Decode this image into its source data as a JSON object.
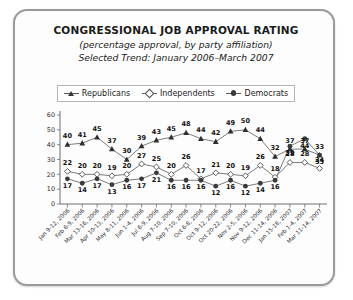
{
  "titles": {
    "main": "CONGRESSIONAL JOB APPROVAL RATING",
    "sub1": "(percentage approval, by party affiliation)",
    "sub2": "Selected Trend: January 2006–March 2007"
  },
  "legend": {
    "items": [
      {
        "label": "Republicans",
        "marker": "triangle-marker",
        "color": "#2e2e2e"
      },
      {
        "label": "Independents",
        "marker": "diamond-marker",
        "color": "#ffffff"
      },
      {
        "label": "Democrats",
        "marker": "circle-marker",
        "color": "#3a3a3a"
      }
    ]
  },
  "chart_data": {
    "type": "line",
    "title": "CONGRESSIONAL JOB APPROVAL RATING",
    "subtitle": "(percentage approval, by party affiliation)",
    "xlabel": "",
    "ylabel": "",
    "ylim": [
      0,
      60
    ],
    "yticks": [
      0,
      10,
      20,
      30,
      40,
      50,
      60
    ],
    "grid": false,
    "legend_position": "top",
    "categories": [
      "Jan 9-12, 2006",
      "Feb 6-9, 2006",
      "Mar 13-16, 2006",
      "Apr 10-13, 2006",
      "May 8-11, 2006",
      "Jun 1-4, 2006",
      "Jul 6-9, 2006",
      "Aug 7-10, 2006",
      "Sep 7-10, 2006",
      "Oct 6-8, 2006",
      "Oct 9-12, 2006",
      "Oct 20-22, 2006",
      "Nov 2-5, 2006",
      "Nov 9-12, 2006",
      "Dec 11-14, 2006",
      "Jan 15-18, 2007",
      "Feb 1-4, 2007",
      "Mar 11-14, 2007"
    ],
    "series": [
      {
        "name": "Republicans",
        "marker": "triangle",
        "values": [
          40,
          41,
          45,
          37,
          30,
          39,
          43,
          45,
          48,
          44,
          42,
          49,
          50,
          44,
          32,
          37,
          37,
          33
        ]
      },
      {
        "name": "Independents",
        "marker": "diamond",
        "values": [
          22,
          20,
          20,
          19,
          20,
          27,
          25,
          20,
          26,
          17,
          21,
          20,
          19,
          26,
          18,
          28,
          28,
          24
        ]
      },
      {
        "name": "Democrats",
        "marker": "circle",
        "values": [
          17,
          14,
          17,
          13,
          16,
          17,
          21,
          16,
          16,
          16,
          12,
          16,
          12,
          14,
          16,
          39,
          44,
          33
        ]
      }
    ]
  }
}
